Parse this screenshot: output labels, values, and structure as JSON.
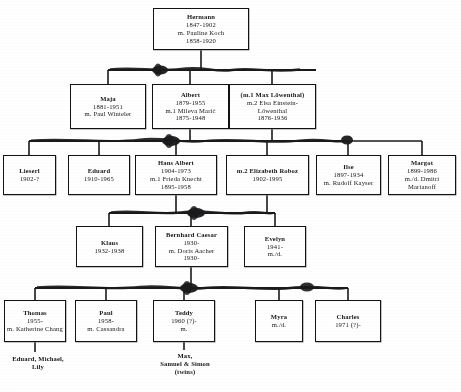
{
  "document": {
    "title": "Einstein Family Tree",
    "kind": "genealogy-chart"
  },
  "nodes": [
    {
      "id": "hermann",
      "name": "node-hermann",
      "lines": [
        "Hermann",
        "1847-1902",
        "m. Pauline Koch",
        "1858-1920"
      ],
      "x": 153,
      "y": 8,
      "w": 96,
      "h": 42
    },
    {
      "id": "maja",
      "name": "node-maja",
      "lines": [
        "Maja",
        "1881-1951",
        "m. Paul Winteler"
      ],
      "x": 70,
      "y": 84,
      "w": 76,
      "h": 45
    },
    {
      "id": "albert",
      "name": "node-albert",
      "lines": [
        "Albert",
        "1879-1955",
        "m.1 Mileva Marić",
        "1875-1948"
      ],
      "x": 152,
      "y": 84,
      "w": 77,
      "h": 45
    },
    {
      "id": "elsa",
      "name": "node-elsa",
      "lines": [
        "(m.1 Max Löwenthal)",
        "m.2 Elsa Einstein-",
        "Löwenthal",
        "1876-1936"
      ],
      "x": 229,
      "y": 84,
      "w": 87,
      "h": 45
    },
    {
      "id": "lieserl",
      "name": "node-lieserl",
      "lines": [
        "Lieserl",
        "1902-?"
      ],
      "x": 3,
      "y": 155,
      "w": 53,
      "h": 40
    },
    {
      "id": "eduard",
      "name": "node-eduard",
      "lines": [
        "Eduard",
        "1910-1965"
      ],
      "x": 68,
      "y": 155,
      "w": 62,
      "h": 40
    },
    {
      "id": "hans-albert",
      "name": "node-hans-albert",
      "lines": [
        "Hans Albert",
        "1904-1973",
        "m.1 Frieda Knecht",
        "1895-1958"
      ],
      "x": 135,
      "y": 155,
      "w": 82,
      "h": 40
    },
    {
      "id": "elizabeth-roboz",
      "name": "node-elizabeth-roboz",
      "lines": [
        "m.2 Elizabeth Roboz",
        "1902-1995"
      ],
      "x": 226,
      "y": 155,
      "w": 83,
      "h": 40
    },
    {
      "id": "ilse",
      "name": "node-ilse",
      "lines": [
        "Ilse",
        "1897-1934",
        "m. Rudolf  Kayser"
      ],
      "x": 316,
      "y": 155,
      "w": 65,
      "h": 40
    },
    {
      "id": "margot",
      "name": "node-margot",
      "lines": [
        "Margot",
        "1899-1986",
        "m./d. Dmitri",
        "Marianoff"
      ],
      "x": 388,
      "y": 155,
      "w": 68,
      "h": 40
    },
    {
      "id": "klaus",
      "name": "node-klaus",
      "lines": [
        "Klaus",
        "1932-1938"
      ],
      "x": 76,
      "y": 226,
      "w": 67,
      "h": 41
    },
    {
      "id": "bernhard",
      "name": "node-bernhard-caesar",
      "lines": [
        "Bernhard Caesar",
        "1930-",
        "m. Doris Aacher",
        "1930-"
      ],
      "x": 155,
      "y": 226,
      "w": 73,
      "h": 41
    },
    {
      "id": "evelyn",
      "name": "node-evelyn",
      "lines": [
        "Evelyn",
        "1941-",
        "m./d."
      ],
      "x": 244,
      "y": 226,
      "w": 62,
      "h": 41
    },
    {
      "id": "thomas",
      "name": "node-thomas",
      "lines": [
        "Thomas",
        "1955-",
        "m. Katherine Chang"
      ],
      "x": 4,
      "y": 300,
      "w": 62,
      "h": 42
    },
    {
      "id": "paul",
      "name": "node-paul",
      "lines": [
        "Paul",
        "1958-",
        "m. Cassandra"
      ],
      "x": 75,
      "y": 300,
      "w": 62,
      "h": 42
    },
    {
      "id": "teddy",
      "name": "node-teddy",
      "lines": [
        "Teddy",
        "1960 (?)-",
        "m."
      ],
      "x": 153,
      "y": 300,
      "w": 62,
      "h": 42
    },
    {
      "id": "myra",
      "name": "node-myra",
      "lines": [
        "Myra",
        "m./d."
      ],
      "x": 255,
      "y": 300,
      "w": 48,
      "h": 42
    },
    {
      "id": "charles",
      "name": "node-charles",
      "lines": [
        "Charles",
        "1971 (?)-"
      ],
      "x": 315,
      "y": 300,
      "w": 66,
      "h": 42
    }
  ],
  "free_text": [
    {
      "id": "thomas-children",
      "name": "children-of-thomas",
      "lines": [
        "Eduard, Michael,",
        "Lily"
      ],
      "x": 3,
      "y": 355,
      "w": 70
    },
    {
      "id": "teddy-children",
      "name": "children-of-teddy",
      "lines": [
        "Max,",
        "Samuel & Simon",
        "(twins)"
      ],
      "x": 145,
      "y": 352,
      "w": 80
    }
  ],
  "colors": {
    "ink": "#121214",
    "paper": "#ffffff",
    "connector": "#1a1a1c"
  }
}
